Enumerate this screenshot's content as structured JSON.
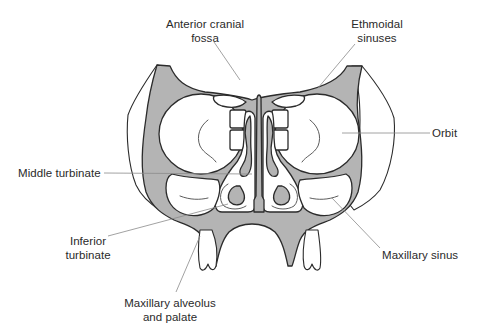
{
  "diagram": {
    "colors": {
      "bone_fill": "#b4b4b4",
      "outline": "#2b2b2b",
      "leader_line": "#8a8a8a",
      "label_text": "#2a2a2a",
      "background": "#ffffff"
    },
    "labels": {
      "anterior_cranial_fossa": {
        "line1": "Anterior cranial",
        "line2": "fossa"
      },
      "ethmoidal_sinuses": {
        "line1": "Ethmoidal",
        "line2": "sinuses"
      },
      "orbit": {
        "line1": "Orbit"
      },
      "middle_turbinate": {
        "line1": "Middle turbinate"
      },
      "inferior_turbinate": {
        "line1": "Inferior",
        "line2": "turbinate"
      },
      "maxillary_sinus": {
        "line1": "Maxillary sinus"
      },
      "maxillary_alveolus": {
        "line1": "Maxillary alveolus",
        "line2": "and palate"
      }
    },
    "structures": [
      "left-orbit",
      "right-orbit",
      "ethmoid-air-cells",
      "nasal-septum",
      "left-middle-turbinate",
      "right-middle-turbinate",
      "left-inferior-turbinate",
      "right-inferior-turbinate",
      "left-maxillary-sinus",
      "right-maxillary-sinus",
      "hard-palate",
      "left-molar",
      "right-molar"
    ]
  }
}
